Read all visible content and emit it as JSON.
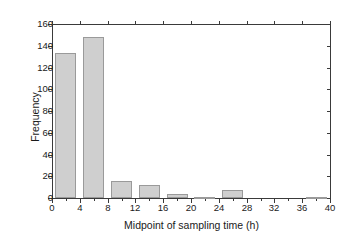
{
  "chart": {
    "y_axis_title": "Frequency",
    "x_axis_title": "Midpoint of sampling time (h)",
    "y_ticks": [
      "0",
      "20",
      "40",
      "60",
      "80",
      "100",
      "120",
      "140",
      "160"
    ],
    "x_ticks": [
      "0",
      "4",
      "8",
      "12",
      "16",
      "20",
      "24",
      "28",
      "32",
      "36",
      "40"
    ],
    "bar_color": "#cfcfcf",
    "bar_edge_color": "#9a9a9a",
    "axis_color": "#3a3a3a"
  },
  "chart_data": {
    "type": "bar",
    "title": "",
    "subtitle": "",
    "xlabel": "Midpoint of sampling time (h)",
    "ylabel": "Frequency",
    "xlim": [
      0,
      40
    ],
    "ylim": [
      0,
      160
    ],
    "xtick_values": [
      0,
      4,
      8,
      12,
      16,
      20,
      24,
      28,
      32,
      36,
      40
    ],
    "ytick_values": [
      0,
      20,
      40,
      60,
      80,
      100,
      120,
      140,
      160
    ],
    "grid": false,
    "legend": null,
    "bin_width": 3,
    "categories": [
      2,
      6,
      10,
      14,
      18,
      22,
      26,
      38
    ],
    "values": [
      133,
      148,
      16,
      12,
      4,
      1,
      7,
      1
    ],
    "bars": [
      {
        "midpoint": 2,
        "left": 0.5,
        "right": 3.5,
        "value": 133
      },
      {
        "midpoint": 6,
        "left": 4.5,
        "right": 7.5,
        "value": 148
      },
      {
        "midpoint": 10,
        "left": 8.5,
        "right": 11.5,
        "value": 16
      },
      {
        "midpoint": 14,
        "left": 12.5,
        "right": 15.5,
        "value": 12
      },
      {
        "midpoint": 18,
        "left": 16.5,
        "right": 19.5,
        "value": 4
      },
      {
        "midpoint": 22,
        "left": 20.5,
        "right": 23.5,
        "value": 1
      },
      {
        "midpoint": 26,
        "left": 24.5,
        "right": 27.5,
        "value": 7
      },
      {
        "midpoint": 38,
        "left": 36.5,
        "right": 39.5,
        "value": 1
      }
    ]
  }
}
